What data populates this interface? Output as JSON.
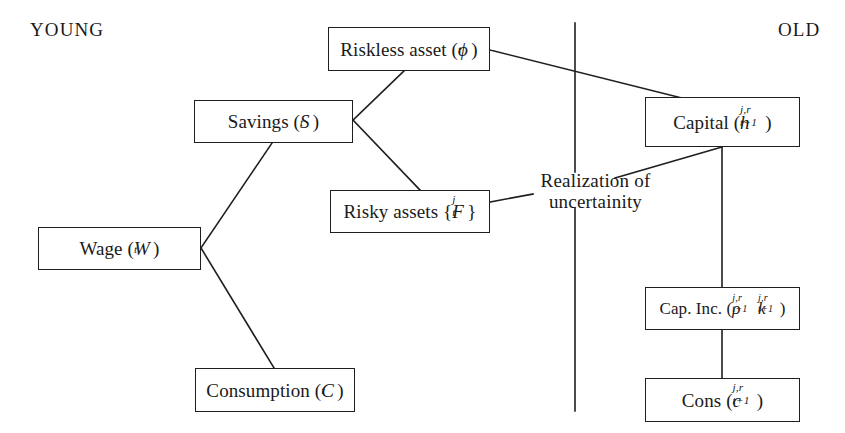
{
  "diagram": {
    "type": "flow-diagram",
    "title_left": "YOUNG",
    "title_right": "OLD",
    "background_color": "#ffffff",
    "line_color": "#1f1f1f",
    "nodes": [
      {
        "id": "riskless",
        "label": "Riskless asset (ϕt)",
        "text_plain": "Riskless asset",
        "symbol_open": " (",
        "symbol_base": "ϕ",
        "symbol_sub": "t",
        "symbol_close": ")"
      },
      {
        "id": "savings",
        "label": "Savings (St)",
        "text_plain": "Savings",
        "symbol_open": " (",
        "symbol_base": "S",
        "symbol_sub": "t",
        "symbol_close": ")"
      },
      {
        "id": "capital",
        "label": "Capital (h j,r t+1)",
        "text_plain": "Capital",
        "symbol_open": " (",
        "symbol_base": "h",
        "symbol_sup": "j,r",
        "symbol_sub": "t+1",
        "symbol_close": ")"
      },
      {
        "id": "risky",
        "label": "Risky assets {F j t}",
        "text_plain": "Risky assets",
        "symbol_open": " {",
        "symbol_base": "F",
        "symbol_sup": "j",
        "symbol_sub": "t",
        "symbol_close": "}"
      },
      {
        "id": "wage",
        "label": "Wage (Wt)",
        "text_plain": "Wage",
        "symbol_open": " (",
        "symbol_base": "W",
        "symbol_sub": "t",
        "symbol_close": ")"
      },
      {
        "id": "capinc",
        "label": "Cap. Inc. (ρ j,r t+1 k j,r t+1)",
        "text_plain": "Cap. Inc.",
        "symbol_open": " (",
        "symbol_base": "ρ",
        "symbol_sup": "j,r",
        "symbol_sub": "t+1",
        "symbol_base2": "k",
        "symbol_sup2": "j,r",
        "symbol_sub2": "t+1",
        "symbol_close": ")"
      },
      {
        "id": "consumption",
        "label": "Consumption (Ct)",
        "text_plain": "Consumption",
        "symbol_open": " (",
        "symbol_base": "C",
        "symbol_sub": "t",
        "symbol_close": ")"
      },
      {
        "id": "cons_old",
        "label": "Cons (c j,r t+1)",
        "text_plain": "Cons",
        "symbol_open": " (",
        "symbol_base": "c",
        "symbol_sup": "j,r",
        "symbol_sub": "t+1",
        "symbol_close": ")"
      }
    ],
    "annotations": [
      {
        "id": "realization",
        "line1": "Realization of",
        "line2": "uncertainity"
      }
    ],
    "edges": [
      {
        "from": "wage",
        "to": "savings"
      },
      {
        "from": "wage",
        "to": "consumption"
      },
      {
        "from": "savings",
        "to": "riskless"
      },
      {
        "from": "savings",
        "to": "risky"
      },
      {
        "from": "riskless",
        "to": "capital"
      },
      {
        "from": "risky",
        "to": "realization"
      },
      {
        "from": "realization",
        "to": "capital"
      },
      {
        "from": "capital",
        "to": "capinc"
      },
      {
        "from": "capinc",
        "to": "cons_old"
      }
    ],
    "divider": {
      "name": "period-divider",
      "orientation": "vertical",
      "segments": 2
    }
  }
}
